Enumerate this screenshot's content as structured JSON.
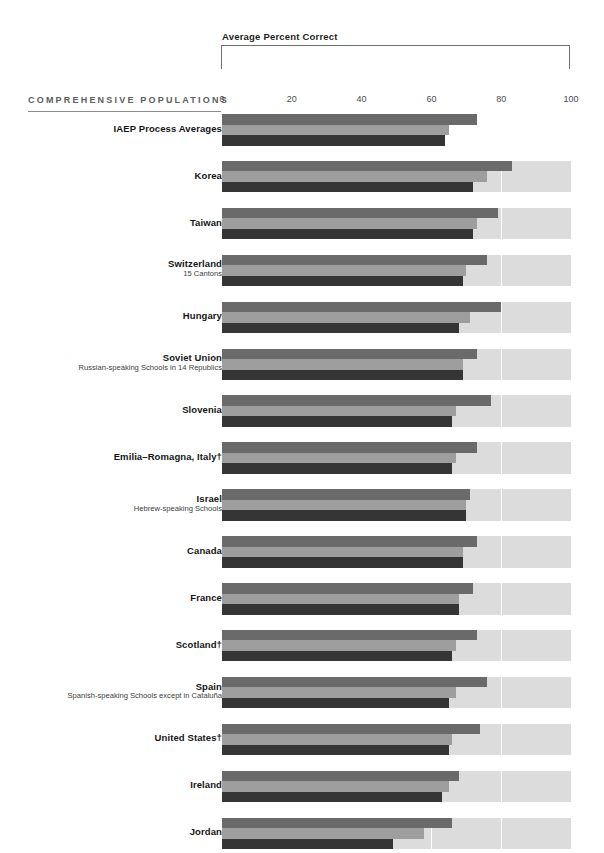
{
  "header": {
    "bracket_title": "Average Percent Correct",
    "section_label": "COMPREHENSIVE POPULATIONS"
  },
  "chart_data": {
    "type": "bar",
    "orientation": "horizontal",
    "title": "Average Percent Correct",
    "subtitle": "COMPREHENSIVE POPULATIONS",
    "xlabel": "",
    "ylabel": "",
    "xlim": [
      0,
      100
    ],
    "xticks": [
      0,
      20,
      40,
      60,
      80,
      100
    ],
    "xtick_labels": [
      "0",
      "20",
      "40",
      "60",
      "80",
      "100"
    ],
    "grid": true,
    "legend_position": "none",
    "series": [
      {
        "name": "Process 1",
        "color": "#6a6a6a"
      },
      {
        "name": "Process 2",
        "color": "#9e9e9e"
      },
      {
        "name": "Process 3",
        "color": "#353535"
      }
    ],
    "categories": [
      "IAEP Process Averages",
      "Korea",
      "Taiwan",
      "Switzerland",
      "Hungary",
      "Soviet Union",
      "Slovenia",
      "Emilia–Romagna, Italy†",
      "Israel",
      "Canada",
      "France",
      "Scotland†",
      "Spain",
      "United States†",
      "Ireland",
      "Jordan"
    ],
    "rows": [
      {
        "name": "IAEP Process Averages",
        "sub": "",
        "values": [
          73,
          65,
          64
        ],
        "full_width_track": false
      },
      {
        "name": "Korea",
        "sub": "",
        "values": [
          83,
          76,
          72
        ],
        "full_width_track": true
      },
      {
        "name": "Taiwan",
        "sub": "",
        "values": [
          79,
          73,
          72
        ],
        "full_width_track": true
      },
      {
        "name": "Switzerland",
        "sub": "15 Cantons",
        "values": [
          76,
          70,
          69
        ],
        "full_width_track": true
      },
      {
        "name": "Hungary",
        "sub": "",
        "values": [
          80,
          71,
          68
        ],
        "full_width_track": true
      },
      {
        "name": "Soviet Union",
        "sub": "Russian-speaking Schools in 14 Republics",
        "values": [
          73,
          69,
          69
        ],
        "full_width_track": true
      },
      {
        "name": "Slovenia",
        "sub": "",
        "values": [
          77,
          67,
          66
        ],
        "full_width_track": true
      },
      {
        "name": "Emilia–Romagna, Italy†",
        "sub": "",
        "values": [
          73,
          67,
          66
        ],
        "full_width_track": true
      },
      {
        "name": "Israel",
        "sub": "Hebrew-speaking Schools",
        "values": [
          71,
          70,
          70
        ],
        "full_width_track": true
      },
      {
        "name": "Canada",
        "sub": "",
        "values": [
          73,
          69,
          69
        ],
        "full_width_track": true
      },
      {
        "name": "France",
        "sub": "",
        "values": [
          72,
          68,
          68
        ],
        "full_width_track": true
      },
      {
        "name": "Scotland†",
        "sub": "",
        "values": [
          73,
          67,
          66
        ],
        "full_width_track": true
      },
      {
        "name": "Spain",
        "sub": "Spanish-speaking Schools except in Cataluña",
        "values": [
          76,
          67,
          65
        ],
        "full_width_track": true
      },
      {
        "name": "United States†",
        "sub": "",
        "values": [
          74,
          66,
          65
        ],
        "full_width_track": true
      },
      {
        "name": "Ireland",
        "sub": "",
        "values": [
          68,
          65,
          63
        ],
        "full_width_track": true
      },
      {
        "name": "Jordan",
        "sub": "",
        "values": [
          66,
          58,
          49
        ],
        "full_width_track": true
      }
    ]
  }
}
